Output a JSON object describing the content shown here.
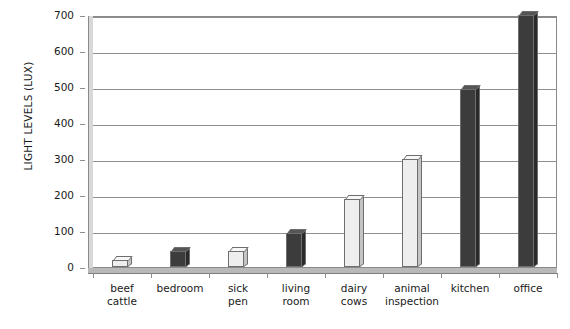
{
  "chart_data": {
    "type": "bar",
    "title": "",
    "xlabel": "",
    "ylabel": "LIGHT LEVELS (LUX)",
    "ylim": [
      0,
      700
    ],
    "ytick_step": 100,
    "yticks": [
      0,
      100,
      200,
      300,
      400,
      500,
      600,
      700
    ],
    "ytick_labels": [
      "0",
      "100",
      "200",
      "300",
      "400",
      "500",
      "600",
      "700"
    ],
    "grid": "horizontal",
    "legend": "none",
    "style": "3d-bar",
    "categories": [
      "beef cattle",
      "bedroom",
      "sick pen",
      "living room",
      "dairy cows",
      "animal inspection",
      "kitchen",
      "office"
    ],
    "category_lines": [
      [
        "beef",
        "cattle"
      ],
      [
        "bedroom",
        ""
      ],
      [
        "sick",
        "pen"
      ],
      [
        "living",
        "room"
      ],
      [
        "dairy",
        "cows"
      ],
      [
        "animal",
        "inspection"
      ],
      [
        "kitchen",
        ""
      ],
      [
        "office",
        ""
      ]
    ],
    "values": [
      20,
      45,
      45,
      95,
      190,
      300,
      495,
      700
    ],
    "bar_shades": [
      "light",
      "dark",
      "light",
      "dark",
      "light",
      "light",
      "dark",
      "dark"
    ],
    "colors": {
      "light_bar": "#eeeeee",
      "dark_bar": "#3c3c3c",
      "axis": "#8e8e8e",
      "text": "#1a1a1a",
      "background": "#ffffff"
    }
  }
}
